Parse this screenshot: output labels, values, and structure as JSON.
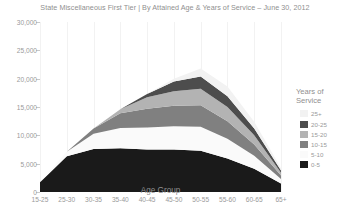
{
  "chart": {
    "title": "State Miscellaneous First Tier | By Attained Age & Years of Service – June 30, 2012",
    "xlabel": "Age Group",
    "legend_title": "Years of\nService",
    "legend_title_line1": "Years of",
    "legend_title_line2": "Service"
  },
  "legend": {
    "items": [
      {
        "label": "25+",
        "color": "#f2f2f2"
      },
      {
        "label": "20-25",
        "color": "#4d4d4d"
      },
      {
        "label": "15-20",
        "color": "#b3b3b3"
      },
      {
        "label": "10-15",
        "color": "#808080"
      },
      {
        "label": "5-10",
        "color": "#fafafa"
      },
      {
        "label": "0-5",
        "color": "#1a1a1a"
      }
    ]
  },
  "chart_data": {
    "type": "area",
    "stacked": true,
    "title": "State Miscellaneous First Tier | By Attained Age & Years of Service – June 30, 2012",
    "xlabel": "Age Group",
    "ylabel": "",
    "legend_title": "Years of Service",
    "legend_position": "right",
    "grid": true,
    "ylim": [
      0,
      30000
    ],
    "yticks": [
      0,
      5000,
      10000,
      15000,
      20000,
      25000,
      30000
    ],
    "ytick_labels": [
      "0",
      "5,000",
      "10,000",
      "15,000",
      "20,000",
      "25,000",
      "30,000"
    ],
    "categories": [
      "15-25",
      "25-30",
      "30-35",
      "35-40",
      "40-45",
      "45-50",
      "50-55",
      "55-60",
      "60-65",
      "65+"
    ],
    "series": [
      {
        "name": "0-5",
        "color": "#1a1a1a",
        "values": [
          1700,
          6300,
          7600,
          7700,
          7500,
          7500,
          7300,
          5900,
          4100,
          1500
        ]
      },
      {
        "name": "5-10",
        "color": "#fafafa",
        "values": [
          0,
          800,
          2700,
          3600,
          3900,
          4100,
          4200,
          3500,
          2300,
          800
        ]
      },
      {
        "name": "10-15",
        "color": "#808080",
        "values": [
          0,
          0,
          900,
          2600,
          3300,
          3600,
          3800,
          3100,
          2000,
          600
        ]
      },
      {
        "name": "15-20",
        "color": "#b3b3b3",
        "values": [
          0,
          0,
          0,
          700,
          2000,
          2600,
          2900,
          2500,
          1600,
          500
        ]
      },
      {
        "name": "20-25",
        "color": "#4d4d4d",
        "values": [
          0,
          0,
          0,
          0,
          600,
          1700,
          2200,
          1900,
          1200,
          400
        ]
      },
      {
        "name": "25+",
        "color": "#f2f2f2",
        "values": [
          0,
          0,
          0,
          0,
          0,
          500,
          1400,
          1700,
          1200,
          400
        ]
      }
    ],
    "totals": [
      1700,
      7100,
      11200,
      14600,
      17300,
      20000,
      21800,
      18600,
      12400,
      4200
    ]
  }
}
